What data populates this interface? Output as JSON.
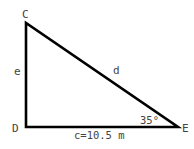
{
  "diagram": {
    "type": "right-triangle",
    "vertices": {
      "C": {
        "label": "C",
        "x": 26,
        "y": 23
      },
      "D": {
        "label": "D",
        "x": 26,
        "y": 127
      },
      "E": {
        "label": "E",
        "x": 178,
        "y": 127
      }
    },
    "sides": {
      "CD": {
        "label": "e"
      },
      "CE": {
        "label": "d"
      },
      "DE": {
        "label": "c=10.5 m"
      }
    },
    "angle_E": {
      "label": "35°"
    },
    "colors": {
      "line": "#000000",
      "text": "#444444",
      "background": "#ffffff"
    }
  }
}
